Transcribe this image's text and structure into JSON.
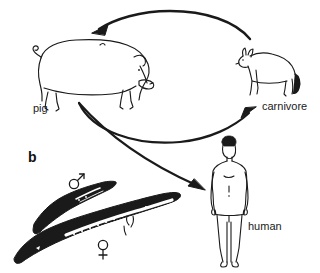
{
  "figure": {
    "panel_letter": "b",
    "background_color": "#ffffff",
    "ink_color": "#1a1a1a",
    "caption_absent": true
  },
  "labels": {
    "pig": "pig",
    "carnivore": "carnivore",
    "human": "human"
  },
  "symbols": {
    "male": "male-symbol",
    "female": "female-symbol"
  },
  "organisms": [
    {
      "name": "pig",
      "label": "pig",
      "facing": "right"
    },
    {
      "name": "carnivore",
      "label": "carnivore",
      "facing": "left"
    },
    {
      "name": "human",
      "label": "human",
      "facing": "front"
    },
    {
      "name": "worm-male",
      "label": "male-symbol",
      "sex": "male"
    },
    {
      "name": "worm-female",
      "label": "female-symbol",
      "sex": "female"
    }
  ],
  "arrows": [
    {
      "name": "arrow-carnivore-to-pig",
      "from": "carnivore",
      "to": "pig",
      "direction": "left"
    },
    {
      "name": "arrow-pig-to-carnivore",
      "from": "pig",
      "to": "carnivore",
      "direction": "up-right"
    },
    {
      "name": "arrow-pig-to-human",
      "from": "pig",
      "to": "human",
      "direction": "down-right"
    }
  ]
}
